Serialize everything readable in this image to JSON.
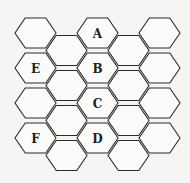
{
  "diagram": {
    "type": "hexagonal-grid",
    "orientation": "flat-top",
    "columns": 5,
    "rows_per_column": 4,
    "hex_radius": 20.5,
    "col_spacing": 31,
    "row_spacing": 35,
    "origin": {
      "x": 35.5,
      "y": 33
    },
    "odd_column_offset_y": 17.5,
    "stroke_color": "#2a2a2a",
    "fill_color": "#fbfbfa",
    "labels": [
      {
        "text": "A",
        "col": 2,
        "row": 0
      },
      {
        "text": "B",
        "col": 2,
        "row": 1
      },
      {
        "text": "C",
        "col": 2,
        "row": 2
      },
      {
        "text": "D",
        "col": 2,
        "row": 3
      },
      {
        "text": "E",
        "col": 0,
        "row": 1
      },
      {
        "text": "F",
        "col": 0,
        "row": 3
      }
    ]
  }
}
